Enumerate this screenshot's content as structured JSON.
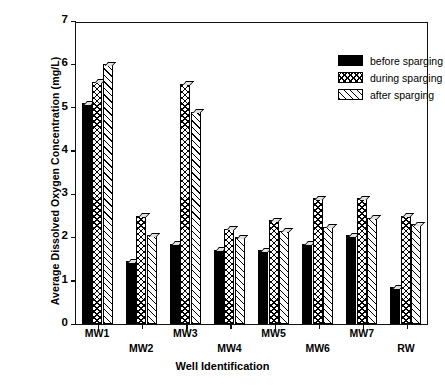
{
  "chart_data": {
    "type": "bar",
    "title": "",
    "xlabel": "Well Identification",
    "ylabel": "Average Dissolved Oxygen Concentration (mg/L)",
    "categories": [
      "MW1",
      "MW2",
      "MW3",
      "MW4",
      "MW5",
      "MW6",
      "MW7",
      "RW"
    ],
    "series": [
      {
        "name": "before sparging",
        "pattern": "solid-black",
        "values": [
          5.1,
          1.45,
          1.85,
          1.72,
          1.7,
          1.85,
          2.05,
          0.85
        ]
      },
      {
        "name": "during sparging",
        "pattern": "crosshatch",
        "values": [
          5.6,
          2.5,
          5.55,
          2.2,
          2.4,
          2.9,
          2.9,
          2.5
        ]
      },
      {
        "name": "after sparging",
        "pattern": "diagonal-hatch",
        "values": [
          6.0,
          2.05,
          4.9,
          2.0,
          2.15,
          2.25,
          2.45,
          2.3
        ]
      }
    ],
    "ylim": [
      0,
      7
    ],
    "yticks": [
      0,
      1,
      2,
      3,
      4,
      5,
      6,
      7
    ],
    "grid": false,
    "legend_position": "top-right"
  },
  "legend": {
    "items": [
      {
        "label": "before sparging"
      },
      {
        "label": "during sparging"
      },
      {
        "label": "after sparging"
      }
    ]
  }
}
